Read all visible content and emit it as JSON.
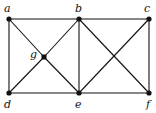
{
  "graph": {
    "nodes": [
      {
        "id": "a",
        "label": "a",
        "x": 9,
        "y": 19,
        "lx": 4,
        "ly": 3
      },
      {
        "id": "b",
        "label": "b",
        "x": 79,
        "y": 19,
        "lx": 75,
        "ly": 3
      },
      {
        "id": "c",
        "label": "c",
        "x": 149,
        "y": 19,
        "lx": 144,
        "ly": 3
      },
      {
        "id": "d",
        "label": "d",
        "x": 9,
        "y": 93,
        "lx": 4,
        "ly": 99
      },
      {
        "id": "e",
        "label": "e",
        "x": 79,
        "y": 93,
        "lx": 75,
        "ly": 99
      },
      {
        "id": "f",
        "label": "f",
        "x": 149,
        "y": 93,
        "lx": 146,
        "ly": 99
      },
      {
        "id": "g",
        "label": "g",
        "x": 44,
        "y": 57,
        "lx": 30,
        "ly": 49
      }
    ],
    "edges": [
      [
        "a",
        "b"
      ],
      [
        "b",
        "c"
      ],
      [
        "a",
        "d"
      ],
      [
        "c",
        "f"
      ],
      [
        "d",
        "e"
      ],
      [
        "e",
        "f"
      ],
      [
        "b",
        "e"
      ],
      [
        "a",
        "g"
      ],
      [
        "g",
        "e"
      ],
      [
        "d",
        "g"
      ],
      [
        "g",
        "b"
      ],
      [
        "b",
        "f"
      ],
      [
        "c",
        "e"
      ]
    ],
    "colors": {
      "line": "#111111",
      "node": "#111111"
    }
  }
}
